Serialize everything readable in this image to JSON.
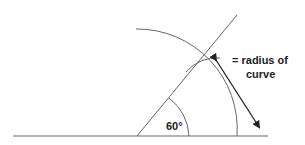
{
  "diagram": {
    "angle_label": "60°",
    "annotation_line1": "= radius of",
    "annotation_line2": "curve",
    "colors": {
      "line": "#555555",
      "text": "#222222",
      "arrow": "#222222"
    }
  }
}
